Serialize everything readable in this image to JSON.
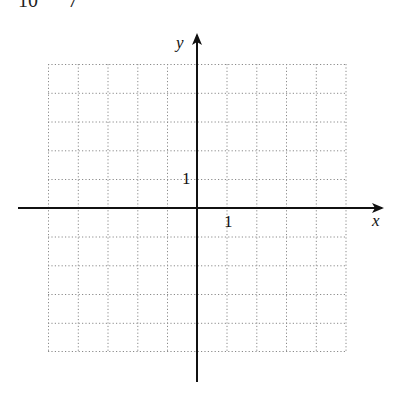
{
  "header": {
    "clipped_text": "10      7"
  },
  "graph": {
    "x_axis_label": "x",
    "y_axis_label": "y",
    "x_unit_label": "1",
    "y_unit_label": "1",
    "grid": {
      "columns": 10,
      "rows": 10,
      "x_range": [
        -5,
        5
      ],
      "y_range": [
        -5,
        5
      ],
      "style": "dotted",
      "color": "#8a8a8a"
    },
    "axis_color": "#111111"
  }
}
